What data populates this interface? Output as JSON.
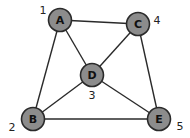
{
  "graph": {
    "nodes": [
      {
        "id": "A",
        "label": "A",
        "number": "1",
        "x": 60,
        "y": 20,
        "nx": 43,
        "ny": 14
      },
      {
        "id": "B",
        "label": "B",
        "number": "2",
        "x": 33,
        "y": 119,
        "nx": 12,
        "ny": 131
      },
      {
        "id": "C",
        "label": "C",
        "number": "4",
        "x": 138,
        "y": 24,
        "nx": 157,
        "ny": 24
      },
      {
        "id": "D",
        "label": "D",
        "number": "3",
        "x": 92,
        "y": 75,
        "nx": 92,
        "ny": 99
      },
      {
        "id": "E",
        "label": "E",
        "number": "5",
        "x": 159,
        "y": 119,
        "nx": 180,
        "ny": 130
      }
    ],
    "edges": [
      {
        "from": "A",
        "to": "C"
      },
      {
        "from": "A",
        "to": "B"
      },
      {
        "from": "A",
        "to": "D"
      },
      {
        "from": "C",
        "to": "D"
      },
      {
        "from": "C",
        "to": "E"
      },
      {
        "from": "B",
        "to": "D"
      },
      {
        "from": "D",
        "to": "E"
      },
      {
        "from": "B",
        "to": "E"
      }
    ],
    "colors": {
      "node_fill": "#8c8c8c",
      "stroke": "#2a2a2a",
      "background": "#ffffff"
    }
  }
}
